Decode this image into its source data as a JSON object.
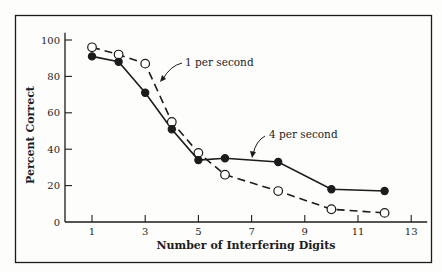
{
  "chart_data": {
    "type": "line",
    "title": "",
    "xlabel": "Number of Interfering Digits",
    "ylabel": "Percent Correct",
    "xlim": [
      0.5,
      13.5
    ],
    "ylim": [
      0,
      100
    ],
    "xticks": [
      1,
      3,
      5,
      7,
      9,
      11,
      13
    ],
    "xticks_minor": [
      2,
      4,
      6,
      8,
      10,
      12
    ],
    "yticks": [
      0,
      20,
      40,
      60,
      80,
      100
    ],
    "grid": false,
    "legend": "inline annotations with arrows",
    "series": [
      {
        "name": "1 per second",
        "style": "dashed",
        "marker": "open-circle",
        "x": [
          1,
          2,
          3,
          4,
          5,
          6,
          8,
          10,
          12
        ],
        "values": [
          96,
          92,
          87,
          55,
          38,
          26,
          17,
          7,
          5
        ]
      },
      {
        "name": "4 per second",
        "style": "solid",
        "marker": "filled-circle",
        "x": [
          1,
          2,
          3,
          4,
          5,
          6,
          8,
          10,
          12
        ],
        "values": [
          91,
          88,
          71,
          51,
          34,
          35,
          33,
          18,
          17
        ]
      }
    ],
    "annotations": [
      {
        "text": "1 per second",
        "points_to_series": "1 per second"
      },
      {
        "text": "4 per second",
        "points_to_series": "4 per second"
      }
    ]
  },
  "colors": {
    "ink": "#1c1c1c",
    "background": "#fdfdfc"
  }
}
